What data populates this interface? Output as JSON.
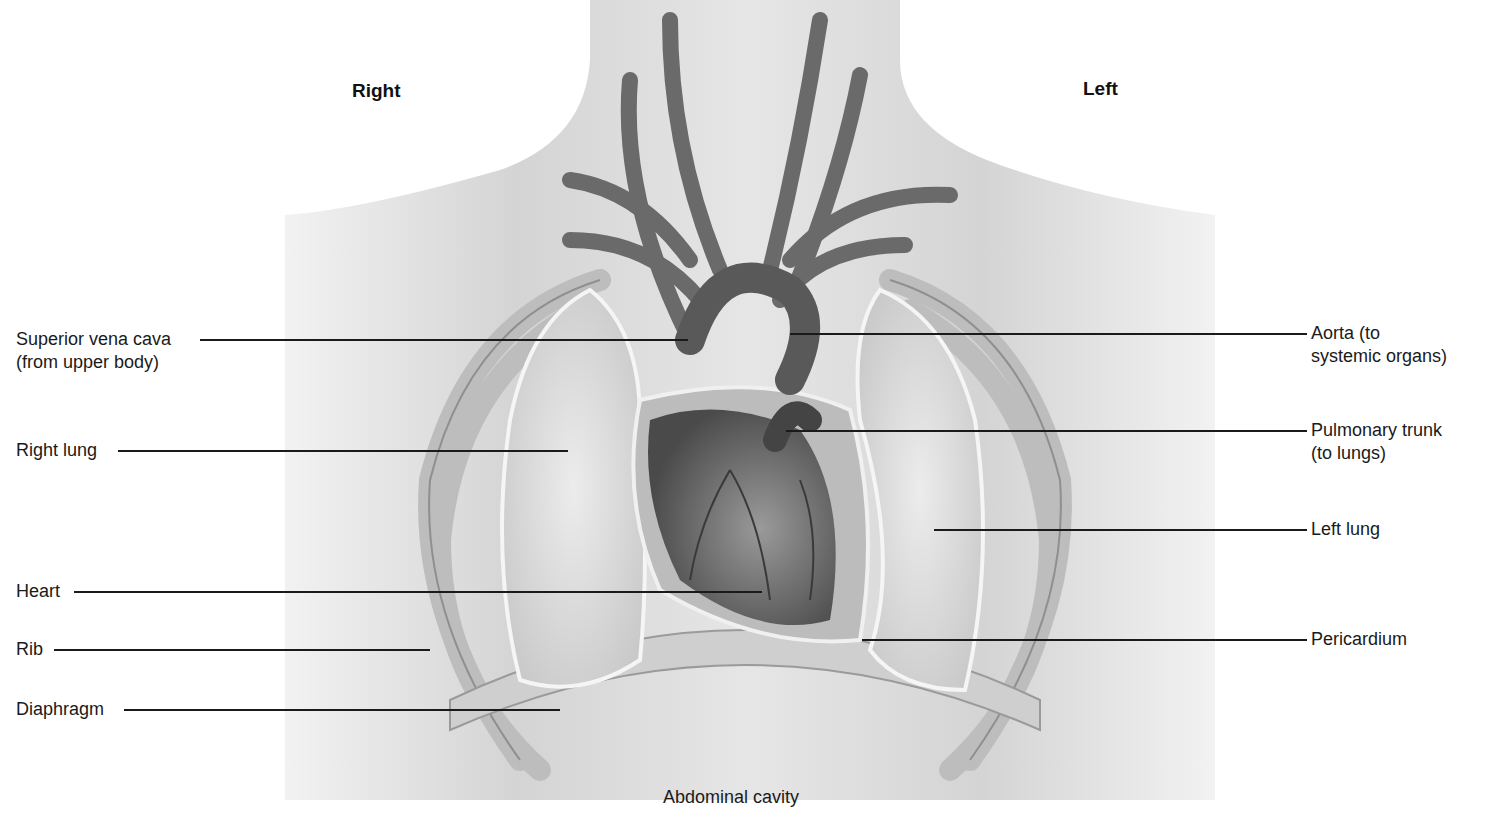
{
  "orientation": {
    "right": "Right",
    "left": "Left"
  },
  "labels_left": [
    {
      "id": "superior-vena-cava",
      "line1": "Superior vena cava",
      "line2": "(from upper body)",
      "y": 339,
      "text_x": 16,
      "line_x1": 200,
      "line_x2": 688
    },
    {
      "id": "right-lung",
      "line1": "Right lung",
      "line2": "",
      "y": 450,
      "text_x": 16,
      "line_x1": 118,
      "line_x2": 568
    },
    {
      "id": "heart",
      "line1": "Heart",
      "line2": "",
      "y": 591,
      "text_x": 16,
      "line_x1": 74,
      "line_x2": 762
    },
    {
      "id": "rib",
      "line1": "Rib",
      "line2": "",
      "y": 649,
      "text_x": 16,
      "line_x1": 54,
      "line_x2": 430
    },
    {
      "id": "diaphragm",
      "line1": "Diaphragm",
      "line2": "",
      "y": 709,
      "text_x": 16,
      "line_x1": 124,
      "line_x2": 560
    }
  ],
  "labels_right": [
    {
      "id": "aorta",
      "line1": "Aorta (to",
      "line2": "systemic organs)",
      "y": 333,
      "text_x": 1311,
      "line_x1": 790,
      "line_x2": 1307
    },
    {
      "id": "pulmonary-trunk",
      "line1": "Pulmonary trunk",
      "line2": "(to lungs)",
      "y": 430,
      "text_x": 1311,
      "line_x1": 786,
      "line_x2": 1307
    },
    {
      "id": "left-lung",
      "line1": "Left lung",
      "line2": "",
      "y": 529,
      "text_x": 1311,
      "line_x1": 934,
      "line_x2": 1307
    },
    {
      "id": "pericardium",
      "line1": "Pericardium",
      "line2": "",
      "y": 639,
      "text_x": 1311,
      "line_x1": 862,
      "line_x2": 1307
    }
  ],
  "bottom_label": "Abdominal cavity",
  "colors": {
    "skin": "#d9d9d9",
    "lung": "#e3e3e3",
    "vessel": "#6a6a6a",
    "heart": "#7a7a7a",
    "line": "#1a1a1a"
  }
}
